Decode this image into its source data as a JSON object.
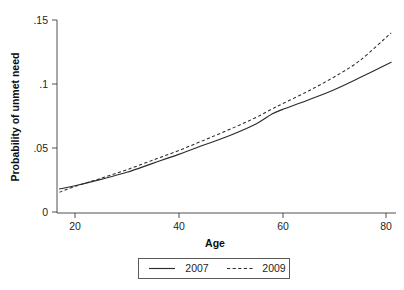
{
  "chart_data": {
    "type": "line",
    "title": "",
    "xlabel": "Age",
    "ylabel": "Probability of unmet need",
    "xlim": [
      17,
      81
    ],
    "ylim": [
      0,
      0.15
    ],
    "grid": false,
    "legend_position": "bottom-center",
    "xticks": [
      20,
      40,
      60,
      80
    ],
    "xtick_labels": [
      "20",
      "40",
      "60",
      "80"
    ],
    "yticks": [
      0,
      0.05,
      0.1,
      0.15
    ],
    "ytick_labels": [
      "0",
      ".05",
      ".1",
      ".15"
    ],
    "x": [
      17,
      20,
      25,
      30,
      35,
      40,
      45,
      50,
      55,
      58,
      60,
      65,
      70,
      75,
      81
    ],
    "series": [
      {
        "name": "2007",
        "style": "solid",
        "color": "#2b2b2b",
        "values": [
          0.018,
          0.0205,
          0.0255,
          0.031,
          0.038,
          0.045,
          0.0525,
          0.06,
          0.069,
          0.0765,
          0.08,
          0.0875,
          0.0955,
          0.105,
          0.117
        ]
      },
      {
        "name": "2009",
        "style": "dashed",
        "color": "#2b2b2b",
        "values": [
          0.0155,
          0.02,
          0.0263,
          0.033,
          0.0405,
          0.048,
          0.0563,
          0.0648,
          0.074,
          0.0805,
          0.0845,
          0.0945,
          0.1055,
          0.1185,
          0.14
        ]
      }
    ]
  },
  "legend": {
    "entries": [
      {
        "label": "2007",
        "style": "solid"
      },
      {
        "label": "2009",
        "style": "dashed"
      }
    ]
  }
}
